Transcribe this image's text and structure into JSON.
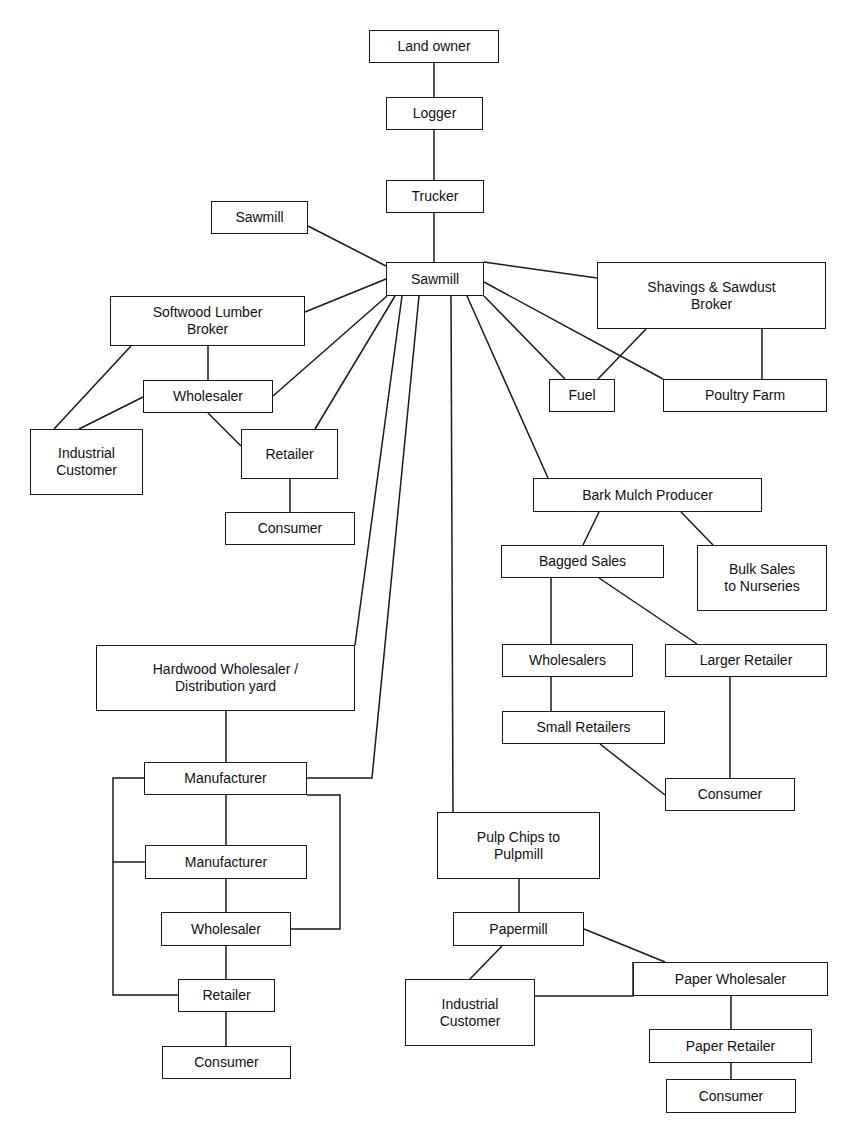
{
  "diagram": {
    "type": "flowchart",
    "line_color": "#1a1a1a",
    "nodes": [
      {
        "id": "land_owner",
        "label": "Land owner",
        "x": 369,
        "y": 30,
        "w": 130,
        "h": 33
      },
      {
        "id": "logger",
        "label": "Logger",
        "x": 386,
        "y": 97,
        "w": 97,
        "h": 33
      },
      {
        "id": "trucker",
        "label": "Trucker",
        "x": 386,
        "y": 180,
        "w": 98,
        "h": 33
      },
      {
        "id": "sawmill_side",
        "label": "Sawmill",
        "x": 211,
        "y": 201,
        "w": 97,
        "h": 33
      },
      {
        "id": "sawmill",
        "label": "Sawmill",
        "x": 386,
        "y": 262,
        "w": 98,
        "h": 34
      },
      {
        "id": "softwood_broker",
        "label": "Softwood Lumber\nBroker",
        "x": 110,
        "y": 296,
        "w": 195,
        "h": 50
      },
      {
        "id": "shavings_broker",
        "label": "Shavings & Sawdust\nBroker",
        "x": 597,
        "y": 262,
        "w": 229,
        "h": 67
      },
      {
        "id": "softwood_wholesaler",
        "label": "Wholesaler",
        "x": 143,
        "y": 380,
        "w": 130,
        "h": 33
      },
      {
        "id": "fuel",
        "label": "Fuel",
        "x": 549,
        "y": 379,
        "w": 66,
        "h": 33
      },
      {
        "id": "poultry_farm",
        "label": "Poultry Farm",
        "x": 663,
        "y": 379,
        "w": 164,
        "h": 33
      },
      {
        "id": "softwood_industrial",
        "label": "Industrial\nCustomer",
        "x": 30,
        "y": 429,
        "w": 113,
        "h": 66
      },
      {
        "id": "softwood_retailer",
        "label": "Retailer",
        "x": 241,
        "y": 429,
        "w": 97,
        "h": 50
      },
      {
        "id": "softwood_consumer",
        "label": "Consumer",
        "x": 225,
        "y": 512,
        "w": 130,
        "h": 33
      },
      {
        "id": "bark_mulch",
        "label": "Bark Mulch Producer",
        "x": 533,
        "y": 478,
        "w": 229,
        "h": 34
      },
      {
        "id": "bagged_sales",
        "label": "Bagged Sales",
        "x": 501,
        "y": 545,
        "w": 163,
        "h": 33
      },
      {
        "id": "bulk_sales",
        "label": "Bulk Sales\nto Nurseries",
        "x": 697,
        "y": 545,
        "w": 130,
        "h": 66
      },
      {
        "id": "hardwood_wholesaler",
        "label": "Hardwood Wholesaler /\nDistribution yard",
        "x": 96,
        "y": 645,
        "w": 259,
        "h": 66
      },
      {
        "id": "mulch_wholesalers",
        "label": "Wholesalers",
        "x": 502,
        "y": 644,
        "w": 131,
        "h": 33
      },
      {
        "id": "larger_retailer",
        "label": "Larger Retailer",
        "x": 665,
        "y": 644,
        "w": 162,
        "h": 33
      },
      {
        "id": "small_retailers",
        "label": "Small Retailers",
        "x": 502,
        "y": 711,
        "w": 163,
        "h": 33
      },
      {
        "id": "hw_manufacturer_1",
        "label": "Manufacturer",
        "x": 144,
        "y": 762,
        "w": 163,
        "h": 33
      },
      {
        "id": "mulch_consumer",
        "label": "Consumer",
        "x": 665,
        "y": 778,
        "w": 130,
        "h": 33
      },
      {
        "id": "pulp_chips",
        "label": "Pulp Chips to\nPulpmill",
        "x": 437,
        "y": 812,
        "w": 163,
        "h": 67
      },
      {
        "id": "hw_manufacturer_2",
        "label": "Manufacturer",
        "x": 145,
        "y": 845,
        "w": 162,
        "h": 34
      },
      {
        "id": "hw_wholesaler",
        "label": "Wholesaler",
        "x": 161,
        "y": 912,
        "w": 130,
        "h": 34
      },
      {
        "id": "papermill",
        "label": "Papermill",
        "x": 453,
        "y": 912,
        "w": 131,
        "h": 34
      },
      {
        "id": "paper_wholesaler",
        "label": "Paper Wholesaler",
        "x": 633,
        "y": 962,
        "w": 195,
        "h": 34
      },
      {
        "id": "hw_retailer",
        "label": "Retailer",
        "x": 178,
        "y": 979,
        "w": 97,
        "h": 33
      },
      {
        "id": "paper_industrial",
        "label": "Industrial\nCustomer",
        "x": 405,
        "y": 979,
        "w": 130,
        "h": 67
      },
      {
        "id": "paper_retailer",
        "label": "Paper Retailer",
        "x": 649,
        "y": 1029,
        "w": 163,
        "h": 34
      },
      {
        "id": "hw_consumer",
        "label": "Consumer",
        "x": 162,
        "y": 1046,
        "w": 129,
        "h": 33
      },
      {
        "id": "paper_consumer",
        "label": "Consumer",
        "x": 666,
        "y": 1079,
        "w": 130,
        "h": 34
      }
    ],
    "edges": [
      {
        "from": "land_owner",
        "to": "logger",
        "points": [
          [
            434,
            63
          ],
          [
            434,
            97
          ]
        ]
      },
      {
        "from": "logger",
        "to": "trucker",
        "points": [
          [
            434,
            130
          ],
          [
            434,
            180
          ]
        ]
      },
      {
        "from": "trucker",
        "to": "sawmill",
        "points": [
          [
            434,
            213
          ],
          [
            434,
            262
          ]
        ]
      },
      {
        "from": "sawmill_side",
        "to": "sawmill",
        "points": [
          [
            308,
            226
          ],
          [
            386,
            266
          ]
        ]
      },
      {
        "from": "sawmill",
        "to": "softwood_broker",
        "points": [
          [
            386,
            279
          ],
          [
            305,
            312
          ]
        ]
      },
      {
        "from": "sawmill",
        "to": "softwood_wholesaler",
        "points": [
          [
            387,
            296
          ],
          [
            273,
            396
          ]
        ]
      },
      {
        "from": "sawmill",
        "to": "softwood_retailer",
        "points": [
          [
            395,
            296
          ],
          [
            315,
            429
          ]
        ]
      },
      {
        "from": "sawmill",
        "to": "hardwood_wholesaler",
        "points": [
          [
            402,
            296
          ],
          [
            355,
            645
          ]
        ]
      },
      {
        "from": "sawmill",
        "to": "hw_manufacturer_1",
        "points": [
          [
            419,
            296
          ],
          [
            372,
            778
          ],
          [
            307,
            778
          ]
        ]
      },
      {
        "from": "sawmill",
        "to": "pulp_chips",
        "points": [
          [
            451,
            296
          ],
          [
            453,
            812
          ]
        ]
      },
      {
        "from": "sawmill",
        "to": "bark_mulch",
        "points": [
          [
            467,
            296
          ],
          [
            548,
            478
          ]
        ]
      },
      {
        "from": "sawmill",
        "to": "fuel",
        "points": [
          [
            484,
            296
          ],
          [
            565,
            379
          ]
        ]
      },
      {
        "from": "sawmill",
        "to": "poultry_farm",
        "points": [
          [
            484,
            282
          ],
          [
            663,
            379
          ]
        ]
      },
      {
        "from": "sawmill",
        "to": "shavings_broker",
        "points": [
          [
            484,
            262
          ],
          [
            597,
            278
          ]
        ]
      },
      {
        "from": "shavings_broker",
        "to": "fuel",
        "points": [
          [
            646,
            329
          ],
          [
            598,
            379
          ]
        ]
      },
      {
        "from": "shavings_broker",
        "to": "poultry_farm",
        "points": [
          [
            762,
            329
          ],
          [
            762,
            379
          ]
        ]
      },
      {
        "from": "softwood_broker",
        "to": "softwood_wholesaler",
        "points": [
          [
            208,
            346
          ],
          [
            208,
            380
          ]
        ]
      },
      {
        "from": "softwood_broker",
        "to": "softwood_industrial",
        "points": [
          [
            131,
            346
          ],
          [
            54,
            429
          ]
        ]
      },
      {
        "from": "softwood_wholesaler",
        "to": "softwood_industrial",
        "points": [
          [
            143,
            397
          ],
          [
            79,
            429
          ]
        ]
      },
      {
        "from": "softwood_wholesaler",
        "to": "softwood_retailer",
        "points": [
          [
            208,
            413
          ],
          [
            241,
            446
          ]
        ]
      },
      {
        "from": "softwood_retailer",
        "to": "softwood_consumer",
        "points": [
          [
            290,
            479
          ],
          [
            290,
            512
          ]
        ]
      },
      {
        "from": "bark_mulch",
        "to": "bagged_sales",
        "points": [
          [
            599,
            512
          ],
          [
            583,
            545
          ]
        ]
      },
      {
        "from": "bark_mulch",
        "to": "bulk_sales",
        "points": [
          [
            681,
            512
          ],
          [
            713,
            545
          ]
        ]
      },
      {
        "from": "bagged_sales",
        "to": "mulch_wholesalers",
        "points": [
          [
            551,
            578
          ],
          [
            551,
            644
          ]
        ]
      },
      {
        "from": "bagged_sales",
        "to": "larger_retailer",
        "points": [
          [
            599,
            578
          ],
          [
            697,
            644
          ]
        ]
      },
      {
        "from": "mulch_wholesalers",
        "to": "small_retailers",
        "points": [
          [
            551,
            677
          ],
          [
            551,
            711
          ]
        ]
      },
      {
        "from": "small_retailers",
        "to": "mulch_consumer",
        "points": [
          [
            600,
            744
          ],
          [
            665,
            795
          ]
        ]
      },
      {
        "from": "larger_retailer",
        "to": "mulch_consumer",
        "points": [
          [
            730,
            677
          ],
          [
            730,
            778
          ]
        ]
      },
      {
        "from": "hardwood_wholesaler",
        "to": "hw_manufacturer_1",
        "points": [
          [
            226,
            711
          ],
          [
            226,
            762
          ]
        ]
      },
      {
        "from": "hw_manufacturer_1",
        "to": "hw_manufacturer_2",
        "points": [
          [
            226,
            795
          ],
          [
            226,
            845
          ]
        ]
      },
      {
        "from": "hw_manufacturer_2",
        "to": "hw_wholesaler",
        "points": [
          [
            226,
            879
          ],
          [
            226,
            912
          ]
        ]
      },
      {
        "from": "hw_wholesaler",
        "to": "hw_retailer",
        "points": [
          [
            226,
            946
          ],
          [
            226,
            979
          ]
        ]
      },
      {
        "from": "hw_retailer",
        "to": "hw_consumer",
        "points": [
          [
            226,
            1012
          ],
          [
            226,
            1046
          ]
        ]
      },
      {
        "from": "hw_manufacturer_1",
        "to": "hw_retailer",
        "points": [
          [
            144,
            778
          ],
          [
            113,
            778
          ],
          [
            113,
            995
          ],
          [
            178,
            995
          ]
        ]
      },
      {
        "from": "left_bracket",
        "to": "hw_manufacturer_2",
        "points": [
          [
            113,
            862
          ],
          [
            145,
            862
          ]
        ]
      },
      {
        "from": "hw_manufacturer_1",
        "to": "hw_wholesaler",
        "points": [
          [
            307,
            795
          ],
          [
            340,
            795
          ],
          [
            340,
            929
          ],
          [
            291,
            929
          ]
        ]
      },
      {
        "from": "pulp_chips",
        "to": "papermill",
        "points": [
          [
            519,
            879
          ],
          [
            519,
            912
          ]
        ]
      },
      {
        "from": "papermill",
        "to": "paper_industrial",
        "points": [
          [
            502,
            946
          ],
          [
            470,
            979
          ]
        ]
      },
      {
        "from": "papermill",
        "to": "paper_wholesaler",
        "points": [
          [
            584,
            929
          ],
          [
            665,
            962
          ]
        ]
      },
      {
        "from": "paper_industrial",
        "to": "paper_wholesaler",
        "points": [
          [
            535,
            996
          ],
          [
            633,
            996
          ],
          [
            633,
            962
          ]
        ]
      },
      {
        "from": "paper_wholesaler",
        "to": "paper_retailer",
        "points": [
          [
            731,
            996
          ],
          [
            731,
            1029
          ]
        ]
      },
      {
        "from": "paper_retailer",
        "to": "paper_consumer",
        "points": [
          [
            731,
            1063
          ],
          [
            731,
            1079
          ]
        ]
      }
    ]
  }
}
